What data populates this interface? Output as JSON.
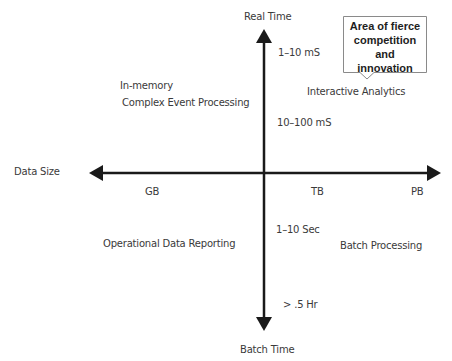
{
  "axes": {
    "y_top_label": "Real Time",
    "y_bottom_label": "Batch Time",
    "x_label": "Data Size",
    "x_ticks": [
      "GB",
      "TB",
      "PB"
    ],
    "y_ticks": [
      "1–10 mS",
      "10–100 mS",
      "1–10 Sec",
      "> .5 Hr"
    ]
  },
  "quadrants": {
    "top_left_line1": "In-memory",
    "top_left_line2": "Complex Event Processing",
    "top_right": "Interactive Analytics",
    "bottom_left": "Operational Data Reporting",
    "bottom_right": "Batch Processing"
  },
  "callout": {
    "line1": "Area of fierce",
    "line2": "competition and",
    "line3": "innovation"
  },
  "colors": {
    "axis": "#1a1a1a",
    "text": "#3a3a3a",
    "callout_border": "#8a8a8a"
  }
}
